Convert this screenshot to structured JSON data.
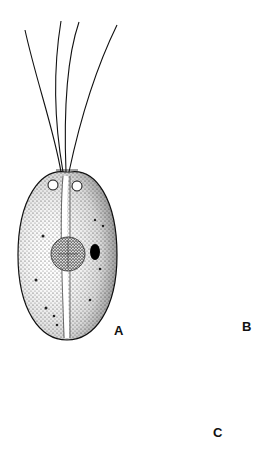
{
  "figure": {
    "panels": [
      {
        "id": "A",
        "label": "A",
        "description": "Front view of flagellate cell with four flagella, two contractile vacuoles, central nucleus, eyespot"
      },
      {
        "id": "B",
        "label": "B",
        "description": "Side view of elongated cell with four flagella and nucleus"
      },
      {
        "id": "C",
        "label": "C",
        "description": "Apical (top) view of cell showing four lobes and two vacuoles"
      }
    ],
    "colors": {
      "ink": "#111111",
      "stipple": "#555555",
      "background": "#ffffff"
    }
  }
}
